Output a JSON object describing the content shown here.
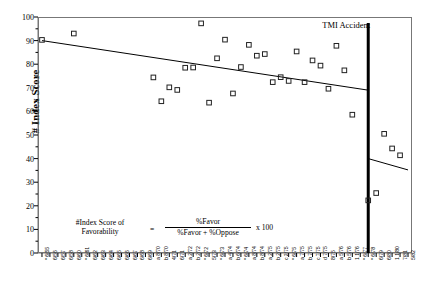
{
  "chart_data": {
    "type": "scatter",
    "title": "",
    "xlabel": "",
    "ylabel": "# Index Score",
    "ylim": [
      0,
      100
    ],
    "ytick_values": [
      0,
      10,
      20,
      30,
      40,
      50,
      60,
      70,
      80,
      90,
      100
    ],
    "grid": false,
    "legend": null,
    "xtick_labels": [
      "* 6/55",
      "6/56",
      "6/57",
      "6/58",
      "6/60",
      "* 6/61",
      "6/62",
      "6/63",
      "6/64",
      "6/65",
      "6/66",
      "6/67",
      "6/68",
      "6/69",
      "a 8/70",
      "b 8/70",
      "4/71",
      "6/71",
      "a 2/72",
      "b 2/72",
      "* 6/72",
      "5/73",
      "* 6/73",
      "a 4/74",
      "b 6/74",
      "* 6/74",
      "a 8/74",
      "b 8/74",
      "a 2/75",
      "b 2/75",
      "c 2/75",
      "* 6/75",
      "a 7/75",
      "b 7/75",
      "c 7/75",
      "d 7/75",
      "8/75",
      "a 5/76",
      "b 5/76",
      "1 1/76",
      "* 6/77",
      "* 6/78",
      "6/79",
      "6/80",
      "1 1/80",
      "7/81",
      "5/82"
    ],
    "points": [
      {
        "label": "* 6/55",
        "x": 0,
        "y": 90.3
      },
      {
        "label": "6/60",
        "x": 4,
        "y": 93.0
      },
      {
        "label": "a 8/70",
        "x": 14,
        "y": 74.4
      },
      {
        "label": "b 8/70",
        "x": 15,
        "y": 64.3
      },
      {
        "label": "4/71",
        "x": 16,
        "y": 70.2
      },
      {
        "label": "6/71",
        "x": 17,
        "y": 69.1
      },
      {
        "label": "a 2/72",
        "x": 18,
        "y": 78.5
      },
      {
        "label": "b 2/72",
        "x": 19,
        "y": 78.6
      },
      {
        "label": "* 6/72",
        "x": 20,
        "y": 97.3
      },
      {
        "label": "5/73",
        "x": 21,
        "y": 63.7
      },
      {
        "label": "* 6/73",
        "x": 22,
        "y": 82.5
      },
      {
        "label": "a 4/74",
        "x": 23,
        "y": 90.4
      },
      {
        "label": "b 6/74",
        "x": 24,
        "y": 67.6
      },
      {
        "label": "* 6/74",
        "x": 25,
        "y": 78.8
      },
      {
        "label": "a 8/74",
        "x": 26,
        "y": 88.2
      },
      {
        "label": "b 8/74",
        "x": 27,
        "y": 83.6
      },
      {
        "label": "a 2/75",
        "x": 28,
        "y": 84.3
      },
      {
        "label": "b 2/75",
        "x": 29,
        "y": 72.4
      },
      {
        "label": "c 2/75",
        "x": 30,
        "y": 74.5
      },
      {
        "label": "* 6/75",
        "x": 31,
        "y": 72.9
      },
      {
        "label": "a 7/75",
        "x": 32,
        "y": 85.4
      },
      {
        "label": "b 7/75",
        "x": 33,
        "y": 72.4
      },
      {
        "label": "c 7/75",
        "x": 34,
        "y": 81.6
      },
      {
        "label": "d 7/75",
        "x": 35,
        "y": 79.4
      },
      {
        "label": "8/75",
        "x": 36,
        "y": 69.6
      },
      {
        "label": "a 5/76",
        "x": 37,
        "y": 87.8
      },
      {
        "label": "b 5/76",
        "x": 38,
        "y": 77.4
      },
      {
        "label": "1 1/76",
        "x": 39,
        "y": 58.6
      },
      {
        "label": "* 6/78",
        "x": 41,
        "y": 22.3
      },
      {
        "label": "6/79",
        "x": 42,
        "y": 25.4
      },
      {
        "label": "6/80",
        "x": 43,
        "y": 50.5
      },
      {
        "label": "1 1/80",
        "x": 44,
        "y": 44.3
      },
      {
        "label": "7/81",
        "x": 45,
        "y": 41.4
      }
    ],
    "trend_lines": [
      {
        "name": "pre-TMI-trend",
        "x_start": 0,
        "y_start": 90.0,
        "x_end": 41,
        "y_end": 69.0
      },
      {
        "name": "post-TMI-trend",
        "x_start": 41,
        "y_start": 40.0,
        "x_end": 46,
        "y_end": 35.2
      }
    ],
    "annotations": [
      {
        "name": "tmi-accident-marker",
        "label": "TMI Accident",
        "x": 41,
        "type": "vertical-line"
      }
    ]
  },
  "formula_box": {
    "left_line1": "#Index Score of",
    "left_line2": "Favorability",
    "equals": "=",
    "numerator": "%Favor",
    "denominator": "%Favor + %Oppose",
    "multiplier": "x 100"
  },
  "colors": {
    "axis": "#777777",
    "marker_stroke": "#222222",
    "trend_line": "#000000",
    "event_line": "#000000",
    "text": "#000000"
  }
}
